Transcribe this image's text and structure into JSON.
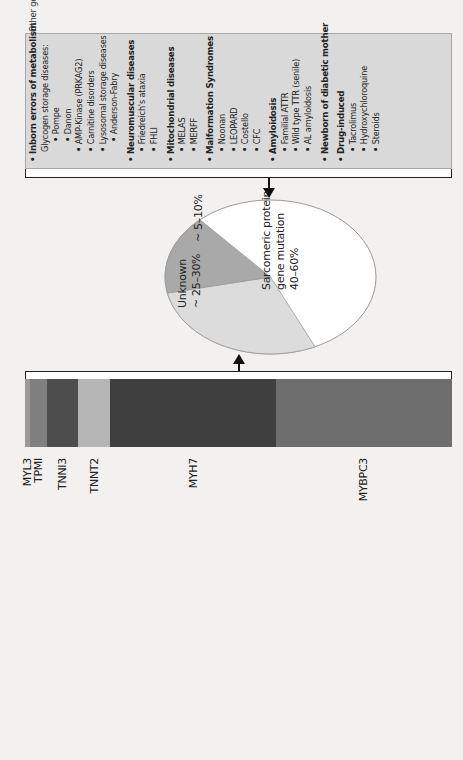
{
  "bar": {
    "segments": [
      {
        "gene": "MYL3",
        "color": "#9a9a9a",
        "start": 0,
        "end": 5
      },
      {
        "gene": "TPMI",
        "color": "#7f7f7f",
        "start": 5,
        "end": 22
      },
      {
        "gene": "TNNI3",
        "color": "#4d4d4d",
        "start": 22,
        "end": 53
      },
      {
        "gene": "TNNT2",
        "color": "#b5b5b5",
        "start": 53,
        "end": 85
      },
      {
        "gene": "MYH7",
        "color": "#3f3f3f",
        "start": 85,
        "end": 251
      },
      {
        "gene": "MYBPC3",
        "color": "#6e6e6e",
        "start": 251,
        "end": 427
      }
    ],
    "labels": {
      "myl3": "MYL3",
      "tpm1": "TPMI",
      "tnni3": "TNNI3",
      "tnnt2": "TNNT2",
      "myh7": "MYH7",
      "mybpc3": "MYBPC3"
    }
  },
  "pie": {
    "slices": [
      {
        "label": "Sarcomeric protein gene mutation",
        "value": "40–60%",
        "color": "#ffffff"
      },
      {
        "label": "Unknown",
        "value": "~ 25–30%",
        "color": "#dcdcdc"
      },
      {
        "label": "",
        "value": "~ 5–10%",
        "color": "#a9a9a9"
      }
    ],
    "sarcomeric_line1": "Sarcomeric protein",
    "sarcomeric_line2": "gene mutation",
    "sarcomeric_line3": "40–60%",
    "unknown_line1": "Unknown",
    "unknown_line2": "~ 25–30%",
    "other_value": "~ 5–10%"
  },
  "panel": {
    "caption": "Other genetic and non-genetic causes",
    "items": [
      {
        "text": "Inborn errors of metabolism",
        "bold": true,
        "level": 0,
        "bullet": true
      },
      {
        "text": "Glycogen storage diseases:",
        "bold": false,
        "level": 1,
        "bullet": false
      },
      {
        "text": "Pompe",
        "bold": false,
        "level": 2,
        "bullet": true
      },
      {
        "text": "Danon",
        "bold": false,
        "level": 2,
        "bullet": true
      },
      {
        "text": "AMP-Kinase (PRKAG2)",
        "bold": false,
        "level": 1,
        "bullet": true
      },
      {
        "text": "Carnitine disorders",
        "bold": false,
        "level": 1,
        "bullet": true
      },
      {
        "text": "Lysosomal storage diseases",
        "bold": false,
        "level": 1,
        "bullet": true
      },
      {
        "text": "Anderson-Fabry",
        "bold": false,
        "level": 2,
        "bullet": true
      },
      {
        "text": "Neuromuscular diseases",
        "bold": true,
        "level": 0,
        "bullet": true
      },
      {
        "text": "Friedreich's ataxia",
        "bold": false,
        "level": 1,
        "bullet": true
      },
      {
        "text": "FHLI",
        "bold": false,
        "level": 1,
        "bullet": true
      },
      {
        "text": "Mitochondrial diseases",
        "bold": true,
        "level": 0,
        "bullet": true
      },
      {
        "text": "MELAS",
        "bold": false,
        "level": 1,
        "bullet": true
      },
      {
        "text": "MERFF",
        "bold": false,
        "level": 1,
        "bullet": true
      },
      {
        "text": "Malformation Syndromes",
        "bold": true,
        "level": 0,
        "bullet": true
      },
      {
        "text": "Noonan",
        "bold": false,
        "level": 1,
        "bullet": true
      },
      {
        "text": "LEOPARD",
        "bold": false,
        "level": 1,
        "bullet": true
      },
      {
        "text": "Costello",
        "bold": false,
        "level": 1,
        "bullet": true
      },
      {
        "text": "CFC",
        "bold": false,
        "level": 1,
        "bullet": true
      },
      {
        "text": "Amyloidosis",
        "bold": true,
        "level": 0,
        "bullet": true
      },
      {
        "text": "Familial ATTR",
        "bold": false,
        "level": 1,
        "bullet": true
      },
      {
        "text": "Wild type TTR (senile)",
        "bold": false,
        "level": 1,
        "bullet": true
      },
      {
        "text": "AL amyloidosis",
        "bold": false,
        "level": 1,
        "bullet": true
      },
      {
        "text": "Newborn of diabetic mother",
        "bold": true,
        "level": 0,
        "bullet": true
      },
      {
        "text": "Drug-induced",
        "bold": true,
        "level": 0,
        "bullet": true
      },
      {
        "text": "Tacrolimus",
        "bold": false,
        "level": 1,
        "bullet": true
      },
      {
        "text": "Hydroxychloroquine",
        "bold": false,
        "level": 1,
        "bullet": true
      },
      {
        "text": "Steroids",
        "bold": false,
        "level": 1,
        "bullet": true
      }
    ]
  },
  "arrows": [
    {
      "name": "bar-to-pie-arrow",
      "direction": "toward-pie"
    },
    {
      "name": "panel-to-pie-arrow",
      "direction": "toward-pie"
    }
  ]
}
